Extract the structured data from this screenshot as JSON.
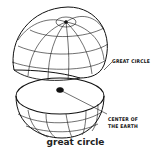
{
  "diagram": {
    "labels": {
      "great_circle": "GREAT CIRCLE",
      "center_line1": "CENTER OF",
      "center_line2": "THE EARTH"
    },
    "caption": "great circle",
    "colors": {
      "stroke": "#111111",
      "background": "#ffffff"
    }
  }
}
